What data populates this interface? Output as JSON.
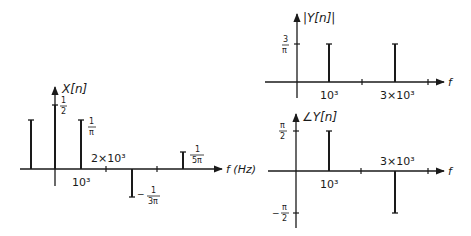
{
  "left_plot": {
    "ylabel": "X[n]",
    "xlabel": "f (Hz)",
    "labels": {
      "half_num": "1",
      "half_den": "2",
      "inv_pi_num": "1",
      "inv_pi_den": "π",
      "neg_3pi_sign": "−",
      "neg_3pi_num": "1",
      "neg_3pi_den": "3π",
      "inv_5pi_num": "1",
      "inv_5pi_den": "5π",
      "tick_1e3": "10³",
      "tick_2e3": "2×10³"
    }
  },
  "top_right_plot": {
    "ylabel": "|Y[n]|",
    "xlabel": "f",
    "labels": {
      "mag_num": "3",
      "mag_den": "π",
      "tick_1e3": "10³",
      "tick_3e3": "3×10³"
    }
  },
  "bottom_right_plot": {
    "ylabel": "∠Y[n]",
    "xlabel": "f",
    "labels": {
      "pos_num": "π",
      "pos_den": "2",
      "neg_sign": "−",
      "neg_num": "π",
      "neg_den": "2",
      "tick_1e3": "10³",
      "tick_3e3": "3×10³"
    }
  }
}
